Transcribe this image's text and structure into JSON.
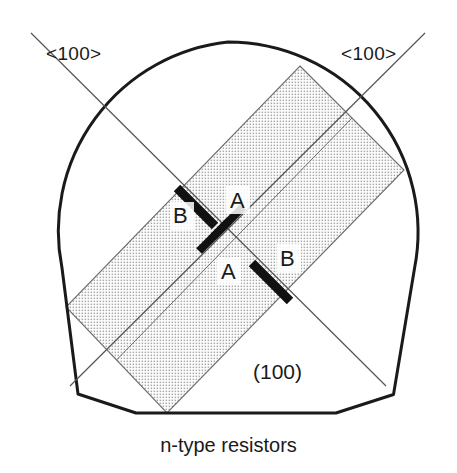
{
  "figure": {
    "caption": "n-type resistors",
    "plane_label": "(100)",
    "direction_labels": {
      "left": "<100>",
      "right": "<100>"
    },
    "resistor_labels": {
      "a_top": "A",
      "b_top": "B",
      "a_bottom": "A",
      "b_bottom": "B"
    },
    "colors": {
      "outline": "#1a1a1a",
      "shading_fill": "#dcdcdc",
      "shading_dot": "#9a9a9a",
      "resistor_bar": "#111111",
      "axis_line": "#555555",
      "background": "#ffffff",
      "text": "#1a1a1a"
    },
    "geometry": {
      "wafer_center": [
        228,
        232
      ],
      "wafer_radius": 190,
      "wafer_flat_y": 413,
      "die_corners": [
        [
          300,
          66
        ],
        [
          404,
          170
        ],
        [
          167,
          413
        ],
        [
          66,
          307
        ]
      ],
      "axis_line_1": [
        [
          30,
          30
        ],
        [
          385,
          385
        ]
      ],
      "axis_line_2": [
        [
          425,
          30
        ],
        [
          70,
          385
        ]
      ]
    },
    "resistors": [
      {
        "name": "B",
        "position": "upper-left",
        "orientation": "NW-SE",
        "length": "long"
      },
      {
        "name": "A",
        "position": "upper-mid",
        "orientation": "NE-SW",
        "length": "short"
      },
      {
        "name": "A",
        "position": "lower-mid",
        "orientation": "NE-SW",
        "length": "short"
      },
      {
        "name": "B",
        "position": "lower-right",
        "orientation": "NW-SE",
        "length": "long"
      }
    ]
  }
}
